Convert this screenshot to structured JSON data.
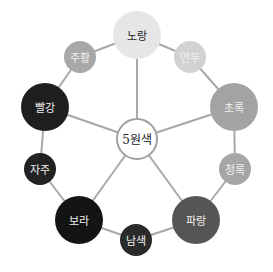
{
  "diagram": {
    "title": "5원색",
    "center": {
      "label": "5원색",
      "x": 137,
      "y": 139,
      "r": 20,
      "fill": "#ffffff",
      "stroke": "#a0a0a0",
      "text_color": "#222222"
    },
    "ring_color": "#a8a8a8",
    "spoke_color": "#a8a8a8",
    "nodes": [
      {
        "id": "yellow",
        "label": "노랑",
        "x": 137,
        "y": 35,
        "r": 24,
        "fill": "#e6e6e6",
        "text_color": "#222222",
        "primary": true
      },
      {
        "id": "yellow-green",
        "label": "연두",
        "x": 190,
        "y": 57,
        "r": 16,
        "fill": "#d2d2d2",
        "text_color": "#f0f0f0",
        "primary": false
      },
      {
        "id": "green",
        "label": "초록",
        "x": 234,
        "y": 107,
        "r": 24,
        "fill": "#a3a3a3",
        "text_color": "#f0f0f0",
        "primary": true
      },
      {
        "id": "blue-green",
        "label": "청록",
        "x": 235,
        "y": 169,
        "r": 16,
        "fill": "#a6a6a6",
        "text_color": "#f0f0f0",
        "primary": false
      },
      {
        "id": "blue",
        "label": "파랑",
        "x": 196,
        "y": 220,
        "r": 24,
        "fill": "#555555",
        "text_color": "#f0f0f0",
        "primary": true
      },
      {
        "id": "navy",
        "label": "남색",
        "x": 136,
        "y": 240,
        "r": 16,
        "fill": "#2a2a2a",
        "text_color": "#f0f0f0",
        "primary": false
      },
      {
        "id": "purple",
        "label": "보라",
        "x": 79,
        "y": 220,
        "r": 24,
        "fill": "#141414",
        "text_color": "#f0f0f0",
        "primary": true
      },
      {
        "id": "magenta",
        "label": "자주",
        "x": 40,
        "y": 169,
        "r": 16,
        "fill": "#222222",
        "text_color": "#f0f0f0",
        "primary": false
      },
      {
        "id": "red",
        "label": "빨강",
        "x": 45,
        "y": 107,
        "r": 24,
        "fill": "#1e1e1e",
        "text_color": "#f0f0f0",
        "primary": true
      },
      {
        "id": "orange",
        "label": "주황",
        "x": 80,
        "y": 57,
        "r": 16,
        "fill": "#a8a8a8",
        "text_color": "#f0f0f0",
        "primary": false
      }
    ]
  }
}
